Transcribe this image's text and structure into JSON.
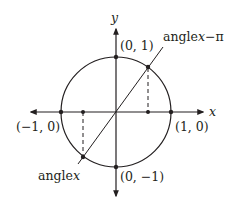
{
  "diagram": {
    "type": "unit-circle",
    "axes": {
      "x_label": "x",
      "y_label": "y"
    },
    "points": {
      "top": "(0, 1)",
      "bottom": "(0, −1)",
      "left": "(−1, 0)",
      "right": "(1, 0)"
    },
    "angle_labels": {
      "upper": {
        "prefix": "angle",
        "var": "x",
        "suffix": "−π"
      },
      "lower": {
        "prefix": "angle",
        "var": "x"
      }
    },
    "colors": {
      "stroke": "#231f20",
      "background": "#ffffff"
    }
  }
}
